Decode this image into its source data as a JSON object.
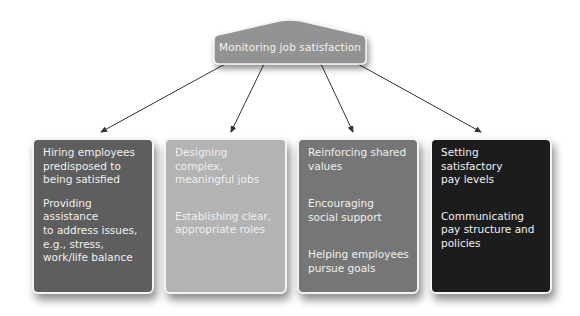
{
  "diagram": {
    "root": {
      "label": "Monitoring job satisfaction",
      "fill": "#939393"
    },
    "cards": [
      {
        "fill": "#5e5e5e",
        "items": [
          "Hiring employees\npredisposed to\nbeing satisfied",
          "Providing assistance\nto address issues,\ne.g., stress,\nwork/life balance"
        ]
      },
      {
        "fill": "#b3b3b3",
        "items": [
          "Designing complex,\nmeaningful jobs",
          "Establishing clear,\nappropriate roles"
        ]
      },
      {
        "fill": "#767676",
        "items": [
          "Reinforcing shared\nvalues",
          "Encouraging\nsocial support",
          "Helping employees\npursue goals"
        ]
      },
      {
        "fill": "#1c1c1c",
        "items": [
          "Setting satisfactory\npay levels",
          "Communicating\npay structure and\npolicies"
        ]
      }
    ],
    "connector_color": "#333333"
  }
}
